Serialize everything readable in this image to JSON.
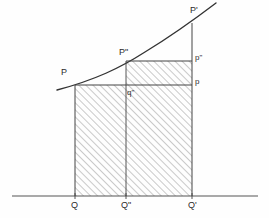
{
  "figure": {
    "width": 269,
    "height": 218,
    "background_color": "#fefefe",
    "stroke_color": "#333333",
    "hatch_color": "#888888",
    "baseline": {
      "name": "horizontal axis",
      "y": 196,
      "x_start": 12,
      "x_end": 258
    },
    "curve": {
      "name": "increasing convex curve",
      "x_start": 57,
      "y_start": 90,
      "x_end": 216,
      "y_end": 3
    },
    "labels": [
      {
        "id": "P",
        "text": "P",
        "x": 61,
        "y": 68,
        "size": "cap"
      },
      {
        "id": "Pprime",
        "text": "P'",
        "x": 190,
        "y": 6,
        "size": "cap"
      },
      {
        "id": "Pdbl",
        "text": "P\"",
        "x": 119,
        "y": 48,
        "size": "cap"
      },
      {
        "id": "pdbl",
        "text": "p\"",
        "x": 195,
        "y": 54,
        "size": "low"
      },
      {
        "id": "p",
        "text": "p",
        "x": 195,
        "y": 78,
        "size": "low"
      },
      {
        "id": "qdbl",
        "text": "q\"",
        "x": 127,
        "y": 89,
        "size": "low"
      },
      {
        "id": "Q",
        "text": "Q",
        "x": 71,
        "y": 201,
        "size": "cap"
      },
      {
        "id": "Qdbl",
        "text": "Q\"",
        "x": 121,
        "y": 201,
        "size": "cap"
      },
      {
        "id": "Qprime",
        "text": "Q'",
        "x": 188,
        "y": 201,
        "size": "cap"
      }
    ],
    "points": {
      "Q": {
        "x": 75,
        "y": 196
      },
      "Qdbl": {
        "x": 126,
        "y": 196
      },
      "Qprime": {
        "x": 192,
        "y": 196
      },
      "P": {
        "x": 75,
        "y": 85
      },
      "Pdbl": {
        "x": 126,
        "y": 61
      },
      "Pprime": {
        "x": 192,
        "y": 23
      },
      "p": {
        "x": 192,
        "y": 85
      },
      "pdbl": {
        "x": 192,
        "y": 61
      },
      "qdbl": {
        "x": 126,
        "y": 85
      }
    },
    "regions": [
      {
        "id": "lower-rect",
        "name": "rectangle Q Q' p P",
        "x": 75,
        "y": 85,
        "w": 117,
        "h": 111,
        "hatched": true
      },
      {
        "id": "upper-rect",
        "name": "rectangle Q\" Q' p\" P\"",
        "x": 126,
        "y": 61,
        "w": 66,
        "h": 24,
        "hatched": true
      }
    ]
  }
}
